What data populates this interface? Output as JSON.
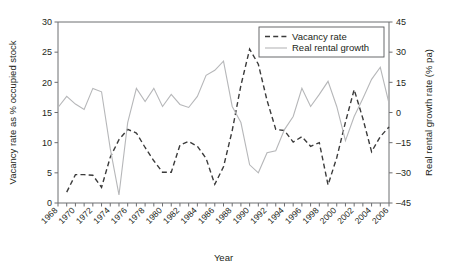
{
  "chart_data": {
    "type": "line",
    "title": "",
    "xlabel": "Year",
    "ylabel": "Vacancy rate as % occupied stock",
    "y2label": "Real rental growth rate (% pa)",
    "xlim": [
      1968,
      2006
    ],
    "ylim": [
      0,
      30
    ],
    "y2lim": [
      -45,
      45
    ],
    "yticks": [
      0,
      5,
      10,
      15,
      20,
      25,
      30
    ],
    "y2ticks": [
      -45,
      -30,
      -15,
      0,
      15,
      30,
      45
    ],
    "xticklabels": [
      "1968",
      "1970",
      "1972",
      "1974",
      "1976",
      "1978",
      "1980",
      "1982",
      "1984",
      "1986",
      "1988",
      "1990",
      "1992",
      "1994",
      "1996",
      "1998",
      "2000",
      "2002",
      "2004",
      "2006"
    ],
    "xtick_years": [
      1968,
      1969,
      1970,
      1971,
      1972,
      1973,
      1974,
      1975,
      1976,
      1977,
      1978,
      1979,
      1980,
      1981,
      1982,
      1983,
      1984,
      1985,
      1986,
      1987,
      1988,
      1989,
      1990,
      1991,
      1992,
      1993,
      1994,
      1995,
      1996,
      1997,
      1998,
      1999,
      2000,
      2001,
      2002,
      2003,
      2004,
      2005,
      2006
    ],
    "grid": false,
    "legend_position": "top-right",
    "x": [
      1968,
      1969,
      1970,
      1971,
      1972,
      1973,
      1974,
      1975,
      1976,
      1977,
      1978,
      1979,
      1980,
      1981,
      1982,
      1983,
      1984,
      1985,
      1986,
      1987,
      1988,
      1989,
      1990,
      1991,
      1992,
      1993,
      1994,
      1995,
      1996,
      1997,
      1998,
      1999,
      2000,
      2001,
      2002,
      2003,
      2004,
      2005,
      2006
    ],
    "series": [
      {
        "name": "Vacancy rate",
        "axis": "left",
        "style": "dashed",
        "color": "#3b3b3b",
        "values": [
          null,
          1.8,
          4.7,
          4.7,
          4.6,
          2.6,
          7.6,
          10.5,
          12.2,
          11.6,
          9.2,
          7.0,
          5.1,
          5.1,
          9.6,
          10.2,
          9.4,
          7.4,
          3.1,
          6.0,
          12.0,
          19.5,
          25.5,
          23.0,
          17.0,
          12.2,
          12.0,
          10.1,
          11.0,
          9.4,
          10.0,
          3.0,
          7.5,
          13.4,
          18.8,
          14.0,
          8.5,
          11.0,
          12.6
        ]
      },
      {
        "name": "Real rental growth",
        "axis": "right",
        "style": "solid",
        "color": "#b6b7b9",
        "values": [
          2.5,
          8.0,
          4.2,
          1.5,
          12.0,
          10.3,
          -18.0,
          -41.0,
          -5.0,
          12.0,
          5.5,
          12.0,
          3.0,
          9.0,
          4.0,
          2.5,
          8.0,
          18.5,
          21.0,
          25.5,
          3.0,
          -5.0,
          -26.0,
          -30.0,
          -20.0,
          -19.0,
          -8.5,
          -2.0,
          12.0,
          3.0,
          9.0,
          15.5,
          3.0,
          -14.0,
          -2.0,
          7.0,
          16.5,
          22.5,
          4.5
        ]
      }
    ]
  },
  "legend": {
    "items": [
      {
        "label": "Vacancy rate"
      },
      {
        "label": "Real rental growth"
      }
    ]
  }
}
